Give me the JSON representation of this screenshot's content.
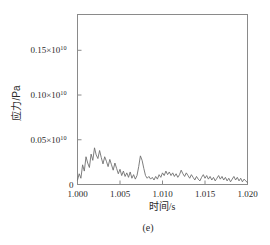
{
  "figure": {
    "caption": "(e)",
    "background": "#ffffff",
    "frame_color": "#8a8a8a",
    "line_color": "#6f6f6f"
  },
  "chart_data": {
    "type": "line",
    "title": "",
    "subtitle": "",
    "xlabel": "时间/s",
    "ylabel": "应力/Pa",
    "xlim": [
      1.0,
      1.02
    ],
    "ylim": [
      0,
      0.19
    ],
    "y_scale_note": "×10^10",
    "grid": false,
    "legend": null,
    "xticks": [
      1.0,
      1.005,
      1.01,
      1.015,
      1.02
    ],
    "xticklabels": [
      "1.000",
      "1.005",
      "1.010",
      "1.015",
      "1.020"
    ],
    "yticks": [
      0,
      0.05,
      0.1,
      0.15
    ],
    "yticklabels": [
      "0",
      "0.05×10",
      "0.10×10",
      "0.15×10"
    ],
    "ytick_exponent": "10",
    "series": [
      {
        "name": "stress",
        "units": "×10^10 Pa",
        "x": [
          1.0,
          1.0002,
          1.0004,
          1.0006,
          1.0008,
          1.001,
          1.0012,
          1.0014,
          1.0016,
          1.0018,
          1.002,
          1.0022,
          1.0024,
          1.0026,
          1.0028,
          1.003,
          1.0032,
          1.0034,
          1.0036,
          1.0038,
          1.004,
          1.0042,
          1.0044,
          1.0046,
          1.0048,
          1.005,
          1.0052,
          1.0054,
          1.0056,
          1.0058,
          1.006,
          1.0062,
          1.0064,
          1.0066,
          1.0068,
          1.007,
          1.0072,
          1.0074,
          1.0076,
          1.0078,
          1.008,
          1.0082,
          1.0084,
          1.0086,
          1.0088,
          1.009,
          1.0092,
          1.0094,
          1.0096,
          1.0098,
          1.01,
          1.0102,
          1.0104,
          1.0106,
          1.0108,
          1.011,
          1.0112,
          1.0114,
          1.0116,
          1.0118,
          1.012,
          1.0122,
          1.0124,
          1.0126,
          1.0128,
          1.013,
          1.0132,
          1.0134,
          1.0136,
          1.0138,
          1.014,
          1.0142,
          1.0144,
          1.0146,
          1.0148,
          1.015,
          1.0152,
          1.0154,
          1.0156,
          1.0158,
          1.016,
          1.0162,
          1.0164,
          1.0166,
          1.0168,
          1.017,
          1.0172,
          1.0174,
          1.0176,
          1.0178,
          1.018,
          1.0182,
          1.0184,
          1.0186,
          1.0188,
          1.019,
          1.0192,
          1.0194,
          1.0196,
          1.0198,
          1.02
        ],
        "y": [
          0.005,
          0.012,
          0.007,
          0.022,
          0.015,
          0.031,
          0.024,
          0.019,
          0.034,
          0.027,
          0.041,
          0.033,
          0.029,
          0.038,
          0.03,
          0.023,
          0.031,
          0.026,
          0.02,
          0.028,
          0.022,
          0.016,
          0.024,
          0.018,
          0.012,
          0.017,
          0.01,
          0.015,
          0.009,
          0.013,
          0.008,
          0.014,
          0.007,
          0.011,
          0.006,
          0.01,
          0.02,
          0.032,
          0.027,
          0.018,
          0.01,
          0.007,
          0.009,
          0.006,
          0.008,
          0.005,
          0.009,
          0.006,
          0.011,
          0.008,
          0.013,
          0.01,
          0.015,
          0.011,
          0.014,
          0.01,
          0.013,
          0.009,
          0.012,
          0.008,
          0.011,
          0.016,
          0.012,
          0.009,
          0.013,
          0.01,
          0.007,
          0.011,
          0.008,
          0.005,
          0.009,
          0.006,
          0.004,
          0.008,
          0.011,
          0.007,
          0.01,
          0.006,
          0.009,
          0.005,
          0.008,
          0.004,
          0.007,
          0.01,
          0.006,
          0.009,
          0.005,
          0.008,
          0.004,
          0.007,
          0.003,
          0.006,
          0.009,
          0.005,
          0.008,
          0.004,
          0.007,
          0.003,
          0.006,
          0.004,
          0.002
        ]
      }
    ]
  }
}
